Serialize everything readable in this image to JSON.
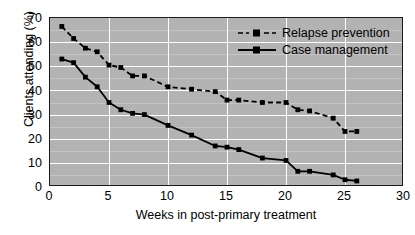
{
  "chart_data": {
    "type": "line",
    "title": "",
    "xlabel": "Weeks in post-primary treatment",
    "ylabel": "Clients attending (%)",
    "xlim": [
      0,
      30
    ],
    "ylim": [
      0,
      70
    ],
    "xticks": [
      0,
      5,
      10,
      15,
      20,
      25,
      30
    ],
    "yticks": [
      0,
      10,
      20,
      30,
      40,
      50,
      60,
      70
    ],
    "grid": true,
    "legend_position": "top-right",
    "plot_background": "#b3b3b3",
    "gridline_color": "#ffffff",
    "series": [
      {
        "name": "Relapse prevention",
        "style": "dashed",
        "marker": "square",
        "color": "#000000",
        "x": [
          1,
          2,
          3,
          4,
          5,
          6,
          7,
          8,
          10,
          12,
          14,
          15,
          16,
          18,
          20,
          21,
          22,
          24,
          25,
          26
        ],
        "values": [
          66.5,
          61.5,
          57.5,
          56.0,
          50.5,
          49.5,
          46.0,
          46.0,
          41.5,
          40.5,
          39.5,
          36.0,
          36.0,
          35.0,
          35.0,
          32.0,
          31.5,
          28.5,
          23.0,
          23.0
        ]
      },
      {
        "name": "Case management",
        "style": "solid",
        "marker": "square",
        "color": "#000000",
        "x": [
          1,
          2,
          3,
          4,
          5,
          6,
          7,
          8,
          10,
          12,
          14,
          15,
          16,
          18,
          20,
          21,
          22,
          24,
          25,
          26
        ],
        "values": [
          53.0,
          51.5,
          45.5,
          41.5,
          35.0,
          32.0,
          30.5,
          30.0,
          25.5,
          21.5,
          17.0,
          16.5,
          15.5,
          12.0,
          11.0,
          6.5,
          6.5,
          5.0,
          3.0,
          2.5
        ]
      }
    ]
  },
  "legend": {
    "items": [
      {
        "label": "Relapse prevention",
        "style": "dashed"
      },
      {
        "label": "Case management",
        "style": "solid"
      }
    ]
  },
  "axes": {
    "x_title": "Weeks in post-primary treatment",
    "y_title": "Clients attending (%)",
    "x_tick_labels": [
      "0",
      "5",
      "10",
      "15",
      "20",
      "25",
      "30"
    ],
    "y_tick_labels": [
      "0",
      "10",
      "20",
      "30",
      "40",
      "50",
      "60",
      "70"
    ]
  }
}
